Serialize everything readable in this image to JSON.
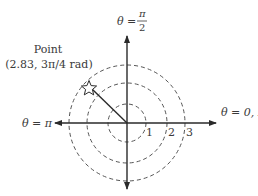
{
  "diagram": {
    "type": "polar-coordinate-diagram",
    "colors": {
      "axis": "#2a2a2a",
      "circle": "#555555",
      "text": "#3a3a3a",
      "background": "#ffffff"
    },
    "axes": {
      "top_label_theta": "θ =",
      "top_label_num": "π",
      "top_label_den": "2",
      "left_label": "θ = π",
      "right_label": "θ = 0, 2π"
    },
    "circles": [
      {
        "radius_value": 1,
        "label": "1"
      },
      {
        "radius_value": 2,
        "label": "2"
      },
      {
        "radius_value": 3,
        "label": "3"
      }
    ],
    "point": {
      "title": "Point",
      "coords_label": "(2.83, 3π/4 rad)",
      "r": 2.83,
      "theta": "3π/4",
      "marker": "star-icon"
    }
  }
}
